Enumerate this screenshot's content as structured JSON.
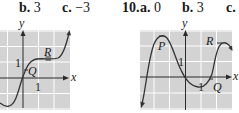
{
  "problem9": {
    "parts": [
      {
        "label": "b.",
        "value": "3"
      },
      {
        "label": "c.",
        "value": "−3"
      }
    ]
  },
  "problem10": {
    "number": "10.",
    "parts": [
      {
        "label": "a.",
        "value": "0"
      },
      {
        "label": "b.",
        "value": "3"
      },
      {
        "label": "c.",
        "value": ""
      }
    ]
  },
  "graph1": {
    "x_axis_label": "x",
    "y_axis_label": "y",
    "x_tick": "1",
    "y_tick": "1",
    "points": [
      {
        "name": "Q"
      },
      {
        "name": "R"
      }
    ],
    "grid_bg": "#d3d3d3",
    "grid_line": "#ffffff",
    "curve_color": "#333333"
  },
  "graph2": {
    "x_axis_label": "x",
    "y_axis_label": "y",
    "x_tick": "1",
    "y_tick": "1",
    "points": [
      {
        "name": "P"
      },
      {
        "name": "R"
      },
      {
        "name": "Q"
      }
    ],
    "grid_bg": "#d3d3d3",
    "grid_line": "#ffffff",
    "curve_color": "#333333"
  }
}
